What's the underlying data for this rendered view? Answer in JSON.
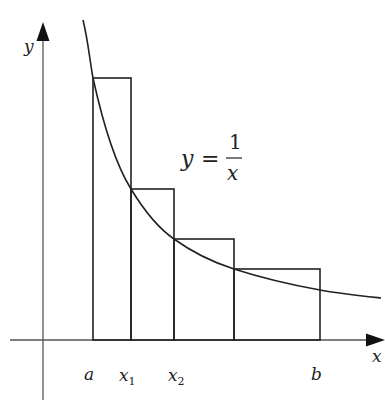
{
  "figure": {
    "colors": {
      "stroke": "#222222",
      "axis": "#555555",
      "background": "#ffffff"
    },
    "axes": {
      "x_label": "x",
      "y_label": "y"
    },
    "equation": {
      "lhs": "y",
      "eq": "=",
      "numerator": "1",
      "denominator": "x"
    },
    "tick_labels": [
      {
        "text": "a",
        "sub": ""
      },
      {
        "text": "x",
        "sub": "1"
      },
      {
        "text": "x",
        "sub": "2"
      },
      {
        "text": "b",
        "sub": ""
      }
    ],
    "rectangles": [
      {
        "x0": "a",
        "x1": "x1",
        "height": "f(a)"
      },
      {
        "x0": "x1",
        "x1": "x2",
        "height": "f(x1)"
      },
      {
        "x0": "x2",
        "x1": "x3",
        "height": "f(x2)"
      },
      {
        "x0": "x3",
        "x1": "b",
        "height": "f(x3)"
      }
    ]
  }
}
